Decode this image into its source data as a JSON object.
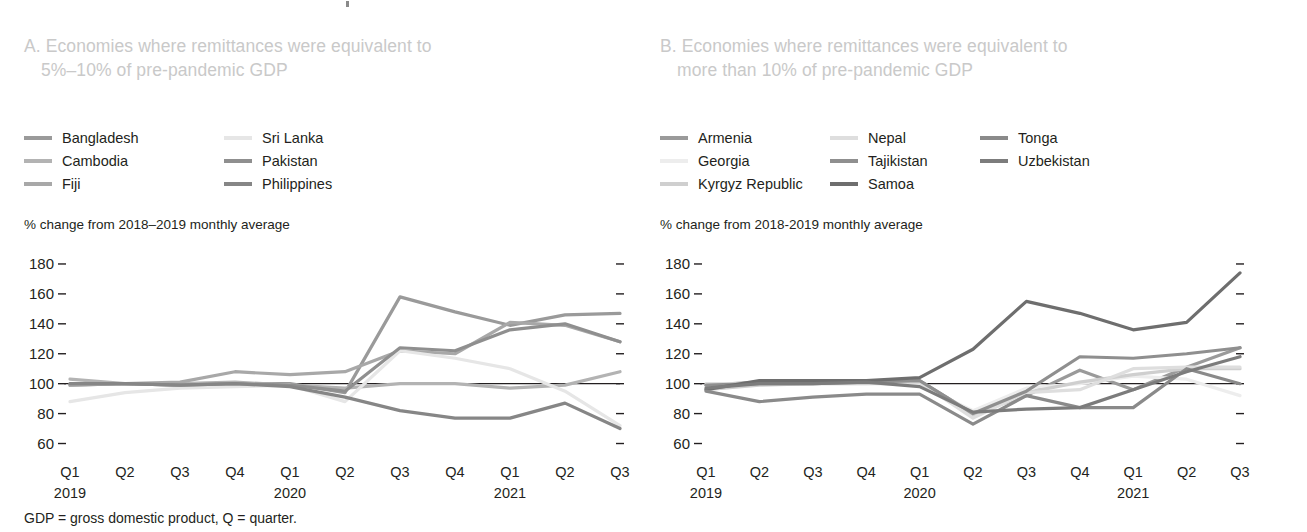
{
  "figure": {
    "footnote": "GDP = gross domestic product, Q = quarter."
  },
  "panel_a": {
    "title_line1": "A. Economies where remittances were equivalent to",
    "title_line2": "5%–10% of pre-pandemic GDP",
    "axis_note": "% change from 2018–2019 monthly average",
    "legend": [
      {
        "label": "Bangladesh",
        "color": "#9a9a9a"
      },
      {
        "label": "Cambodia",
        "color": "#b3b3b3"
      },
      {
        "label": "Fiji",
        "color": "#a8a8a8"
      },
      {
        "label": "Sri Lanka",
        "color": "#e6e6e6"
      },
      {
        "label": "Pakistan",
        "color": "#8f8f8f"
      },
      {
        "label": "Philippines",
        "color": "#868686"
      }
    ]
  },
  "panel_b": {
    "title_line1": "B. Economies where remittances were equivalent to",
    "title_line2": "more than 10% of pre-pandemic GDP",
    "axis_note": "% change from 2018-2019 monthly average",
    "legend": [
      {
        "label": "Armenia",
        "color": "#9a9a9a"
      },
      {
        "label": "Georgia",
        "color": "#ededed"
      },
      {
        "label": "Kyrgyz Republic",
        "color": "#cfcfcf"
      },
      {
        "label": "Nepal",
        "color": "#dedede"
      },
      {
        "label": "Tajikistan",
        "color": "#8f8f8f"
      },
      {
        "label": "Samoa",
        "color": "#6e6e6e"
      },
      {
        "label": "Tonga",
        "color": "#8a8a8a"
      },
      {
        "label": "Uzbekistan",
        "color": "#7c7c7c"
      }
    ]
  },
  "chart_data": [
    {
      "id": "panel-a",
      "type": "line",
      "title": "A. Economies where remittances were equivalent to 5%-10% of pre-pandemic GDP",
      "xlabel": "",
      "ylabel": "% change from 2018-2019 monthly average",
      "ylim": [
        55,
        188
      ],
      "yticks": [
        60,
        80,
        100,
        120,
        140,
        160,
        180
      ],
      "grid": false,
      "legend_position": "top",
      "reference_line": 100,
      "categories": [
        "Q1",
        "Q2",
        "Q3",
        "Q4",
        "Q1",
        "Q2",
        "Q3",
        "Q4",
        "Q1",
        "Q2",
        "Q3"
      ],
      "year_groups": [
        {
          "label": "2019",
          "start_index": 0
        },
        {
          "label": "2020",
          "start_index": 4
        },
        {
          "label": "2021",
          "start_index": 8
        }
      ],
      "series": [
        {
          "name": "Bangladesh",
          "color": "#9a9a9a",
          "values": [
            99,
            100,
            99,
            100,
            100,
            94,
            158,
            148,
            139,
            146,
            147
          ]
        },
        {
          "name": "Cambodia",
          "color": "#b3b3b3",
          "values": [
            103,
            100,
            100,
            101,
            99,
            97,
            100,
            100,
            97,
            99,
            108
          ]
        },
        {
          "name": "Fiji",
          "color": "#a8a8a8",
          "values": [
            99,
            100,
            101,
            108,
            106,
            108,
            122,
            120,
            141,
            139,
            128
          ]
        },
        {
          "name": "Sri Lanka",
          "color": "#e6e6e6",
          "values": [
            88,
            94,
            97,
            98,
            99,
            88,
            122,
            117,
            110,
            95,
            72
          ]
        },
        {
          "name": "Pakistan",
          "color": "#8f8f8f",
          "values": [
            100,
            100,
            99,
            100,
            99,
            95,
            124,
            122,
            136,
            140,
            128
          ]
        },
        {
          "name": "Philippines",
          "color": "#868686",
          "values": [
            100,
            100,
            99,
            100,
            98,
            91,
            82,
            77,
            77,
            87,
            70
          ]
        }
      ]
    },
    {
      "id": "panel-b",
      "type": "line",
      "title": "B. Economies where remittances were equivalent to more than 10% of pre-pandemic GDP",
      "xlabel": "",
      "ylabel": "% change from 2018-2019 monthly average",
      "ylim": [
        55,
        188
      ],
      "yticks": [
        60,
        80,
        100,
        120,
        140,
        160,
        180
      ],
      "grid": false,
      "legend_position": "top",
      "reference_line": 100,
      "categories": [
        "Q1",
        "Q2",
        "Q3",
        "Q4",
        "Q1",
        "Q2",
        "Q3",
        "Q4",
        "Q1",
        "Q2",
        "Q3"
      ],
      "year_groups": [
        {
          "label": "2019",
          "start_index": 0
        },
        {
          "label": "2020",
          "start_index": 4
        },
        {
          "label": "2021",
          "start_index": 8
        }
      ],
      "series": [
        {
          "name": "Armenia",
          "color": "#9a9a9a",
          "values": [
            99,
            101,
            101,
            101,
            102,
            80,
            92,
            109,
            96,
            111,
            124
          ]
        },
        {
          "name": "Georgia",
          "color": "#ededed",
          "values": [
            97,
            100,
            100,
            100,
            99,
            82,
            97,
            100,
            105,
            103,
            92
          ]
        },
        {
          "name": "Kyrgyz Republic",
          "color": "#cfcfcf",
          "values": [
            96,
            99,
            100,
            100,
            101,
            79,
            94,
            101,
            106,
            110,
            110
          ]
        },
        {
          "name": "Nepal",
          "color": "#dedede",
          "values": [
            100,
            100,
            100,
            101,
            101,
            77,
            94,
            96,
            110,
            111,
            111
          ]
        },
        {
          "name": "Tajikistan",
          "color": "#8f8f8f",
          "values": [
            99,
            100,
            100,
            101,
            102,
            80,
            95,
            118,
            117,
            120,
            124
          ]
        },
        {
          "name": "Samoa",
          "color": "#6e6e6e",
          "values": [
            96,
            102,
            102,
            102,
            104,
            123,
            155,
            147,
            136,
            141,
            174
          ]
        },
        {
          "name": "Tonga",
          "color": "#8a8a8a",
          "values": [
            95,
            88,
            91,
            93,
            93,
            73,
            92,
            84,
            84,
            110,
            100
          ]
        },
        {
          "name": "Uzbekistan",
          "color": "#7c7c7c",
          "values": [
            97,
            100,
            100,
            101,
            98,
            81,
            83,
            84,
            96,
            108,
            118
          ]
        }
      ]
    }
  ]
}
